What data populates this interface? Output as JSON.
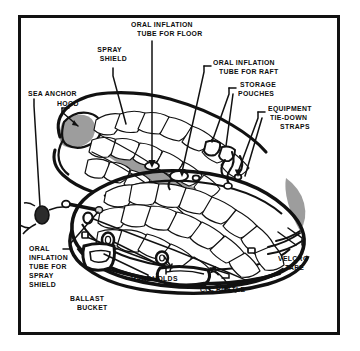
{
  "figure": {
    "type": "technical-line-illustration",
    "background_color": "#ffffff",
    "ink_color": "#111111",
    "shade_color": "#9a9a9a",
    "frame": {
      "border_color": "#111111",
      "border_width_px": 3
    }
  },
  "callouts": {
    "sea_anchor": "SEA ANCHOR",
    "hood": "HOOD",
    "spray_shield_l1": "SPRAY",
    "spray_shield_l2": "SHIELD",
    "oral_floor_l1": "ORAL INFLATION",
    "oral_floor_l2": "TUBE FOR FLOOR",
    "oral_raft_l1": "ORAL INFLATION",
    "oral_raft_l2": "TUBE FOR RAFT",
    "storage_pouches_l1": "STORAGE",
    "storage_pouches_l2": "POUCHES",
    "tiedown_l1": "EQUIPMENT",
    "tiedown_l2": "TIE-DOWN",
    "tiedown_l3": "STRAPS",
    "velcro_l1": "VELCRO",
    "velcro_l2": "TAPE",
    "oral_spray_l1": "ORAL",
    "oral_spray_l2": "INFLATION",
    "oral_spray_l3": "TUBE FOR",
    "oral_spray_l4": "SPRAY",
    "oral_spray_l5": "SHIELD",
    "ballast_l1": "BALLAST",
    "ballast_l2": "BUCKET",
    "handholds": "HANDHOLDS",
    "co2_bottle_pre": "CO",
    "co2_bottle_sub": "2",
    "co2_bottle_post": " BOTTLE"
  }
}
